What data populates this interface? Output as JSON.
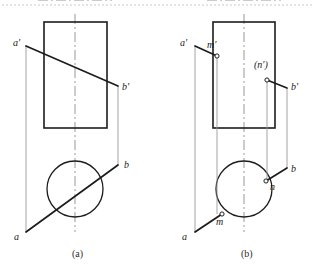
{
  "figure": {
    "background": "#ffffff",
    "top_rule_color": "#c9c9c9",
    "colors": {
      "outline": "#1c1c1c",
      "line_ab": "#1c1c1c",
      "projector": "#9a9a9a",
      "centerline": "#8c8c8c",
      "label": "#1a1a1a",
      "caption": "#2b2b2b"
    }
  },
  "panels": [
    {
      "id": "panel-a",
      "caption": "(a)",
      "caption_x": 72,
      "caption_y": 249,
      "front_view": {
        "name": "rectangle",
        "x": 44,
        "y": 22,
        "width": 63,
        "height": 106
      },
      "top_view": {
        "name": "circle",
        "cx": 75,
        "cy": 189,
        "r": 28
      },
      "centerline_vertical": {
        "x": 75,
        "y1": 14,
        "y2": 232
      },
      "centerline_horizontal": {
        "y": 189,
        "x1": 38,
        "x2": 112
      },
      "line_front": {
        "x1": 26,
        "y1": 46,
        "x2": 118,
        "y2": 86
      },
      "line_top": {
        "x1": 26,
        "y1": 232,
        "x2": 118,
        "y2": 165
      },
      "projector_left": {
        "x": 26,
        "y1": 46,
        "y2": 232
      },
      "projector_right": {
        "x": 118,
        "y1": 86,
        "y2": 165
      },
      "labels": [
        {
          "id": "a-prime",
          "text": "a'",
          "x": 13,
          "y": 38
        },
        {
          "id": "b-prime",
          "text": "b'",
          "x": 122,
          "y": 82
        },
        {
          "id": "b",
          "text": "b",
          "x": 124,
          "y": 160
        },
        {
          "id": "a",
          "text": "a",
          "x": 14,
          "y": 232
        }
      ],
      "markers": []
    },
    {
      "id": "panel-b",
      "caption": "(b)",
      "caption_x": 241,
      "caption_y": 249,
      "front_view": {
        "name": "rectangle",
        "x": 213,
        "y": 22,
        "width": 62,
        "height": 106
      },
      "top_view": {
        "name": "circle",
        "cx": 244,
        "cy": 189,
        "r": 28
      },
      "centerline_vertical": {
        "x": 244,
        "y1": 14,
        "y2": 232
      },
      "centerline_horizontal": {
        "y": 189,
        "x1": 207,
        "x2": 281
      },
      "projector_left": {
        "x": 195,
        "y1": 46,
        "y2": 232
      },
      "projector_right": {
        "x": 287,
        "y1": 88,
        "y2": 168
      },
      "leader_a_prime": {
        "x1": 195,
        "y1": 46,
        "x2": 217,
        "y2": 56
      },
      "leader_b_prime": {
        "x1": 267,
        "y1": 80,
        "x2": 287,
        "y2": 88
      },
      "leader_a": {
        "x1": 195,
        "y1": 232,
        "x2": 222,
        "y2": 214
      },
      "leader_b": {
        "x1": 287,
        "y1": 168,
        "x2": 266,
        "y2": 181
      },
      "projector_m": {
        "x": 217,
        "y1": 56,
        "y2": 214
      },
      "projector_n": {
        "x": 267,
        "y1": 80,
        "y2": 181
      },
      "labels": [
        {
          "id": "a-prime",
          "text": "a'",
          "x": 180,
          "y": 38
        },
        {
          "id": "m-prime",
          "text": "m'",
          "x": 207,
          "y": 40
        },
        {
          "id": "n-prime-hidden",
          "text": "(n')",
          "x": 254,
          "y": 60
        },
        {
          "id": "b-prime",
          "text": "b'",
          "x": 291,
          "y": 82
        },
        {
          "id": "b",
          "text": "b",
          "x": 291,
          "y": 164
        },
        {
          "id": "n",
          "text": "n",
          "x": 270,
          "y": 182
        },
        {
          "id": "m",
          "text": "m",
          "x": 216,
          "y": 217
        },
        {
          "id": "a",
          "text": "a",
          "x": 182,
          "y": 232
        }
      ],
      "markers": [
        {
          "id": "marker-m-prime",
          "cx": 217,
          "cy": 56,
          "r": 2.1
        },
        {
          "id": "marker-n-prime",
          "cx": 267,
          "cy": 80,
          "r": 2.1
        },
        {
          "id": "marker-n",
          "cx": 266,
          "cy": 181,
          "r": 2.1
        },
        {
          "id": "marker-m",
          "cx": 222,
          "cy": 214,
          "r": 2.1
        }
      ]
    }
  ]
}
